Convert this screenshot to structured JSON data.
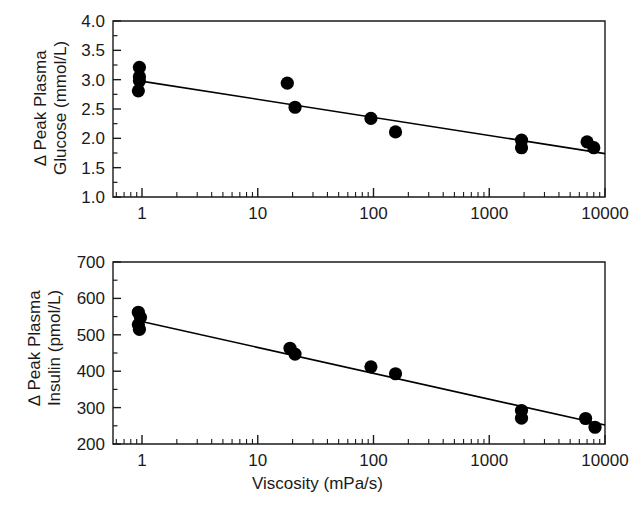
{
  "figure": {
    "background_color": "#ffffff",
    "ink_color": "#1a1a1a",
    "marker_color": "#000000",
    "xlabel": "Viscosity (mPa/s)"
  },
  "chart_data": [
    {
      "type": "scatter",
      "panel_id": "glucose",
      "title": "",
      "xlabel": "Viscosity (mPa/s)",
      "ylabel_line1": "∆ Peak Plasma",
      "ylabel_line2": "Glucose (mmol/L)",
      "xscale": "log",
      "xlim": [
        0.6,
        10000
      ],
      "ylim": [
        1.0,
        4.0
      ],
      "grid": false,
      "legend": "none",
      "xticks": [
        1,
        10,
        100,
        1000,
        10000
      ],
      "xticklabels": [
        "1",
        "10",
        "100",
        "1000",
        "10000"
      ],
      "yticks": [
        1.0,
        1.5,
        2.0,
        2.5,
        3.0,
        3.5,
        4.0
      ],
      "yticklabels": [
        "1.0",
        "1.5",
        "2.0",
        "2.5",
        "3.0",
        "3.5",
        "4.0"
      ],
      "points": [
        {
          "x": 0.95,
          "y": 3.21
        },
        {
          "x": 0.95,
          "y": 3.05
        },
        {
          "x": 0.95,
          "y": 2.98
        },
        {
          "x": 0.93,
          "y": 2.81
        },
        {
          "x": 18.0,
          "y": 2.94
        },
        {
          "x": 21.0,
          "y": 2.53
        },
        {
          "x": 95.0,
          "y": 2.34
        },
        {
          "x": 155.0,
          "y": 2.11
        },
        {
          "x": 1900.0,
          "y": 1.97
        },
        {
          "x": 1900.0,
          "y": 1.84
        },
        {
          "x": 7000.0,
          "y": 1.94
        },
        {
          "x": 8000.0,
          "y": 1.84
        }
      ],
      "fit_line": {
        "type": "linear-on-log-x",
        "x_start": 0.95,
        "y_start": 2.98,
        "x_end": 10000,
        "y_end": 1.74
      }
    },
    {
      "type": "scatter",
      "panel_id": "insulin",
      "title": "",
      "xlabel": "Viscosity (mPa/s)",
      "ylabel_line1": "∆ Peak Plasma",
      "ylabel_line2": "Insulin (pmol/L)",
      "xscale": "log",
      "xlim": [
        0.6,
        10000
      ],
      "ylim": [
        200,
        700
      ],
      "grid": false,
      "legend": "none",
      "xticks": [
        1,
        10,
        100,
        1000,
        10000
      ],
      "xticklabels": [
        "1",
        "10",
        "100",
        "1000",
        "10000"
      ],
      "yticks": [
        200,
        300,
        400,
        500,
        600,
        700
      ],
      "yticklabels": [
        "200",
        "300",
        "400",
        "500",
        "600",
        "700"
      ],
      "points": [
        {
          "x": 0.93,
          "y": 562
        },
        {
          "x": 0.97,
          "y": 548
        },
        {
          "x": 0.93,
          "y": 528
        },
        {
          "x": 0.95,
          "y": 515
        },
        {
          "x": 19.0,
          "y": 463
        },
        {
          "x": 21.0,
          "y": 447
        },
        {
          "x": 95.0,
          "y": 412
        },
        {
          "x": 155.0,
          "y": 393
        },
        {
          "x": 1900.0,
          "y": 292
        },
        {
          "x": 1900.0,
          "y": 271
        },
        {
          "x": 6800.0,
          "y": 270
        },
        {
          "x": 8200.0,
          "y": 246
        }
      ],
      "fit_line": {
        "type": "linear-on-log-x",
        "x_start": 0.95,
        "y_start": 538,
        "x_end": 10000,
        "y_end": 252
      }
    }
  ]
}
